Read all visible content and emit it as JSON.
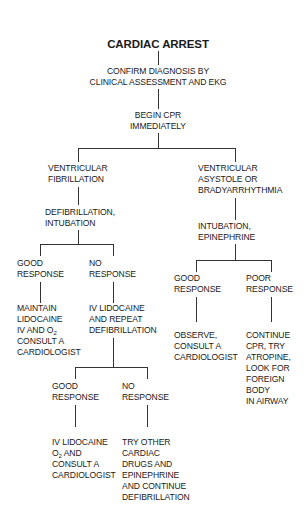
{
  "diagram": {
    "title": "CARDIAC ARREST",
    "nodes": {
      "confirm": "CONFIRM DIAGNOSIS BY\nCLINICAL ASSESSMENT AND EKG",
      "begin_cpr": "BEGIN CPR\nIMMEDIATELY",
      "vfib": "VENTRICULAR\nFIBRILLATION",
      "defib": "DEFIBRILLATION,\nINTUBATION",
      "asystole": "VENTRICULAR\nASYSTOLE OR\nBRADYARRHYTHMIA",
      "intub_epi": "INTUBATION,\nEPINEPHRINE",
      "vf_good": "GOOD\nRESPONSE",
      "vf_no": "NO\nRESPONSE",
      "vf_good_action_1": "MAINTAIN\nLIDOCAINE\nIV AND O",
      "vf_good_action_sub": "2",
      "vf_good_action_2": "CONSULT A\nCARDIOLOGIST",
      "vf_no_action": "IV LIDOCAINE\nAND REPEAT\nDEFIBRILLATION",
      "as_good": "GOOD\nRESPONSE",
      "as_poor": "POOR\nRESPONSE",
      "as_good_action": "OBSERVE,\nCONSULT A\nCARDIOLOGIST",
      "as_poor_action": "CONTINUE\nCPR, TRY\nATROPINE,\nLOOK FOR\nFOREIGN\nBODY\nIN AIRWAY",
      "rep_good": "GOOD\nRESPONSE",
      "rep_no": "NO\nRESPONSE",
      "rep_good_action_1": "IV LIDOCAINE",
      "rep_good_action_o": "O",
      "rep_good_action_sub": "2",
      "rep_good_action_2": " AND",
      "rep_good_action_3": "CONSULT A\nCARDIOLOGIST",
      "rep_no_action": "TRY OTHER\nCARDIAC\nDRUGS AND\nEPINEPHRINE\nAND CONTINUE\nDEFIBRILLATION"
    },
    "line_color": "#333333",
    "text_color": "#1a1a1a"
  }
}
